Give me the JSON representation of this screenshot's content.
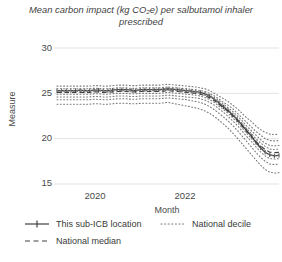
{
  "chart_data": {
    "type": "line",
    "title": "Mean carbon impact (kg CO₂e) per salbutamol inhaler prescribed",
    "xlabel": "Month",
    "ylabel": "Measure",
    "ylim": [
      15,
      30
    ],
    "yticks": [
      30,
      25,
      20,
      15
    ],
    "ytick_labels": [
      "30",
      "25",
      "20",
      "15"
    ],
    "xticks": [
      "2020",
      "2022"
    ],
    "xlim": [
      "2019-03",
      "2023-03"
    ],
    "grid": true,
    "legend_position": "below-axes",
    "x": [
      "2019-03",
      "2019-04",
      "2019-05",
      "2019-06",
      "2019-07",
      "2019-08",
      "2019-09",
      "2019-10",
      "2019-11",
      "2019-12",
      "2020-01",
      "2020-02",
      "2020-03",
      "2020-04",
      "2020-05",
      "2020-06",
      "2020-07",
      "2020-08",
      "2020-09",
      "2020-10",
      "2020-11",
      "2020-12",
      "2021-01",
      "2021-02",
      "2021-03",
      "2021-04",
      "2021-05",
      "2021-06",
      "2021-07",
      "2021-08",
      "2021-09",
      "2021-10",
      "2021-11",
      "2021-12",
      "2022-01",
      "2022-02",
      "2022-03",
      "2022-04",
      "2022-05",
      "2022-06",
      "2022-07",
      "2022-08",
      "2022-09",
      "2022-10",
      "2022-11",
      "2022-12",
      "2023-01",
      "2023-02",
      "2023-03"
    ],
    "series": [
      {
        "name": "This sub-ICB location",
        "style": "solid-with-markers",
        "color": "#404040",
        "values": [
          25.3,
          25.3,
          25.3,
          25.3,
          25.3,
          25.35,
          25.3,
          25.3,
          25.35,
          25.35,
          25.3,
          25.3,
          25.35,
          25.4,
          25.4,
          25.4,
          25.35,
          25.3,
          25.4,
          25.4,
          25.4,
          25.4,
          25.4,
          25.45,
          25.5,
          25.45,
          25.4,
          25.35,
          25.3,
          25.25,
          25.2,
          25.1,
          24.95,
          24.7,
          24.35,
          23.95,
          23.5,
          23.1,
          22.6,
          22.1,
          21.5,
          20.9,
          20.3,
          19.6,
          19.0,
          18.5,
          18.2,
          18.1,
          18.15
        ]
      },
      {
        "name": "National median",
        "style": "dashed",
        "color": "#404040",
        "values": [
          25.1,
          25.1,
          25.1,
          25.1,
          25.1,
          25.1,
          25.1,
          25.1,
          25.15,
          25.15,
          25.1,
          25.1,
          25.15,
          25.2,
          25.2,
          25.2,
          25.15,
          25.15,
          25.2,
          25.2,
          25.2,
          25.2,
          25.2,
          25.25,
          25.3,
          25.25,
          25.2,
          25.15,
          25.1,
          25.05,
          25.0,
          24.9,
          24.75,
          24.5,
          24.2,
          23.8,
          23.4,
          23.0,
          22.5,
          22.0,
          21.4,
          20.8,
          20.3,
          19.7,
          19.2,
          18.8,
          18.5,
          18.45,
          18.5
        ]
      },
      {
        "name": "National decile",
        "style": "dotted",
        "color": "#7a7a7a",
        "decile": 90,
        "values": [
          25.8,
          25.8,
          25.8,
          25.8,
          25.8,
          25.8,
          25.8,
          25.8,
          25.85,
          25.85,
          25.8,
          25.8,
          25.85,
          25.9,
          25.9,
          25.9,
          25.85,
          25.85,
          25.9,
          25.9,
          25.9,
          25.9,
          25.9,
          25.95,
          26.0,
          25.95,
          25.9,
          25.85,
          25.8,
          25.75,
          25.7,
          25.6,
          25.5,
          25.3,
          25.0,
          24.7,
          24.4,
          24.1,
          23.7,
          23.3,
          22.8,
          22.3,
          21.9,
          21.4,
          21.0,
          20.7,
          20.5,
          20.45,
          20.5
        ]
      },
      {
        "name": "National decile",
        "style": "dotted",
        "color": "#7a7a7a",
        "decile": 80,
        "values": [
          25.5,
          25.5,
          25.5,
          25.5,
          25.5,
          25.5,
          25.5,
          25.5,
          25.55,
          25.55,
          25.5,
          25.5,
          25.55,
          25.6,
          25.6,
          25.6,
          25.55,
          25.55,
          25.6,
          25.6,
          25.6,
          25.6,
          25.6,
          25.65,
          25.7,
          25.65,
          25.6,
          25.55,
          25.5,
          25.45,
          25.4,
          25.3,
          25.2,
          25.0,
          24.7,
          24.4,
          24.0,
          23.7,
          23.3,
          22.8,
          22.3,
          21.8,
          21.3,
          20.8,
          20.4,
          20.0,
          19.8,
          19.75,
          19.8
        ]
      },
      {
        "name": "National decile",
        "style": "dotted",
        "color": "#7a7a7a",
        "decile": 70,
        "values": [
          25.3,
          25.3,
          25.3,
          25.3,
          25.3,
          25.3,
          25.3,
          25.3,
          25.35,
          25.35,
          25.3,
          25.3,
          25.35,
          25.4,
          25.4,
          25.4,
          25.35,
          25.35,
          25.4,
          25.4,
          25.4,
          25.4,
          25.4,
          25.45,
          25.5,
          25.45,
          25.4,
          25.35,
          25.3,
          25.25,
          25.2,
          25.1,
          25.0,
          24.8,
          24.5,
          24.2,
          23.8,
          23.4,
          23.0,
          22.5,
          22.0,
          21.4,
          20.9,
          20.4,
          19.9,
          19.5,
          19.25,
          19.2,
          19.25
        ]
      },
      {
        "name": "National decile",
        "style": "dotted",
        "color": "#7a7a7a",
        "decile": 60,
        "values": [
          25.2,
          25.2,
          25.2,
          25.2,
          25.2,
          25.2,
          25.2,
          25.2,
          25.25,
          25.25,
          25.2,
          25.2,
          25.25,
          25.3,
          25.3,
          25.3,
          25.25,
          25.25,
          25.3,
          25.3,
          25.3,
          25.3,
          25.3,
          25.35,
          25.4,
          25.35,
          25.3,
          25.25,
          25.2,
          25.15,
          25.1,
          25.0,
          24.85,
          24.65,
          24.35,
          24.0,
          23.6,
          23.2,
          22.75,
          22.25,
          21.7,
          21.1,
          20.6,
          20.0,
          19.55,
          19.15,
          18.85,
          18.8,
          18.85
        ]
      },
      {
        "name": "National decile",
        "style": "dotted",
        "color": "#7a7a7a",
        "decile": 40,
        "values": [
          24.9,
          24.9,
          24.9,
          24.9,
          24.9,
          24.9,
          24.9,
          24.9,
          24.95,
          24.95,
          24.9,
          24.9,
          24.95,
          25.0,
          25.0,
          25.0,
          24.95,
          24.95,
          25.0,
          25.0,
          25.0,
          25.0,
          25.0,
          25.05,
          25.1,
          25.05,
          25.0,
          24.95,
          24.9,
          24.85,
          24.8,
          24.7,
          24.55,
          24.3,
          24.0,
          23.6,
          23.2,
          22.8,
          22.3,
          21.8,
          21.2,
          20.6,
          20.05,
          19.45,
          18.9,
          18.5,
          18.2,
          18.15,
          18.2
        ]
      },
      {
        "name": "National decile",
        "style": "dotted",
        "color": "#7a7a7a",
        "decile": 30,
        "values": [
          24.6,
          24.6,
          24.6,
          24.6,
          24.6,
          24.6,
          24.6,
          24.6,
          24.65,
          24.65,
          24.6,
          24.6,
          24.65,
          24.7,
          24.7,
          24.7,
          24.65,
          24.65,
          24.7,
          24.7,
          24.7,
          24.7,
          24.7,
          24.75,
          24.8,
          24.75,
          24.7,
          24.65,
          24.6,
          24.55,
          24.5,
          24.4,
          24.25,
          24.0,
          23.7,
          23.3,
          22.9,
          22.45,
          21.95,
          21.45,
          20.85,
          20.25,
          19.7,
          19.1,
          18.55,
          18.1,
          17.8,
          17.75,
          17.8
        ]
      },
      {
        "name": "National decile",
        "style": "dotted",
        "color": "#7a7a7a",
        "decile": 20,
        "values": [
          24.3,
          24.3,
          24.3,
          24.3,
          24.3,
          24.3,
          24.3,
          24.3,
          24.35,
          24.35,
          24.3,
          24.3,
          24.35,
          24.4,
          24.4,
          24.4,
          24.35,
          24.35,
          24.4,
          24.4,
          24.4,
          24.4,
          24.4,
          24.45,
          24.5,
          24.45,
          24.4,
          24.35,
          24.3,
          24.2,
          24.1,
          24.0,
          23.8,
          23.55,
          23.2,
          22.8,
          22.4,
          21.95,
          21.45,
          20.9,
          20.3,
          19.7,
          19.1,
          18.5,
          17.95,
          17.5,
          17.2,
          17.15,
          17.2
        ]
      },
      {
        "name": "National decile",
        "style": "dotted",
        "color": "#7a7a7a",
        "decile": 10,
        "values": [
          23.8,
          23.8,
          23.8,
          23.8,
          23.8,
          23.8,
          23.8,
          23.8,
          23.85,
          23.85,
          23.8,
          23.8,
          23.85,
          23.9,
          23.9,
          23.9,
          23.85,
          23.85,
          23.9,
          23.9,
          23.9,
          23.9,
          23.9,
          23.95,
          24.0,
          23.9,
          23.8,
          23.7,
          23.6,
          23.5,
          23.4,
          23.25,
          23.05,
          22.8,
          22.45,
          22.05,
          21.6,
          21.15,
          20.6,
          20.05,
          19.45,
          18.85,
          18.25,
          17.65,
          17.1,
          16.6,
          16.3,
          16.2,
          16.25
        ]
      }
    ],
    "legend": [
      {
        "label": "This sub-ICB location",
        "key": "line-marker"
      },
      {
        "label": "National decile",
        "key": "dotted-line"
      },
      {
        "label": "National median",
        "key": "dashed-line"
      }
    ]
  }
}
